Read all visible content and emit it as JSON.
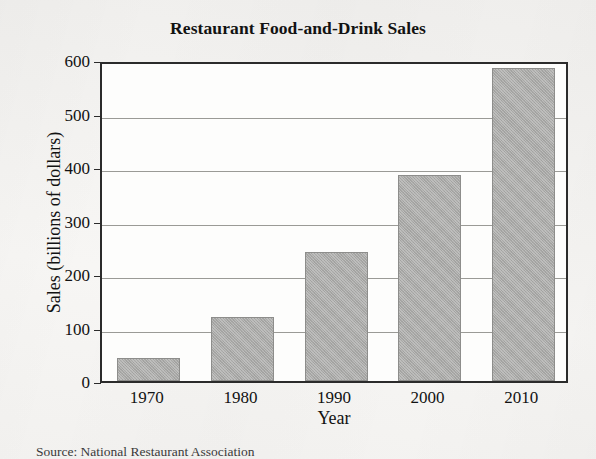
{
  "chart_data": {
    "type": "bar",
    "title": "Restaurant Food-and-Drink Sales",
    "xlabel": "Year",
    "ylabel": "Sales (billions of dollars)",
    "categories": [
      "1970",
      "1980",
      "1990",
      "2000",
      "2010"
    ],
    "values": [
      43,
      120,
      242,
      385,
      585
    ],
    "ylim": [
      0,
      600
    ],
    "yticks": [
      0,
      100,
      200,
      300,
      400,
      500,
      600
    ],
    "ytick_labels": [
      "0",
      "100",
      "200",
      "300",
      "400",
      "500",
      "600"
    ],
    "grid": true,
    "legend": false,
    "series": [
      {
        "name": "Sales",
        "values": [
          43,
          120,
          242,
          385,
          585
        ],
        "color": "#a9a9a7"
      }
    ],
    "source_note": "Source: National Restaurant Association",
    "colors": {
      "bar_fill": "#a9a9a7",
      "bar_border": "#8d8d8b",
      "frame": "#2b2b2b",
      "gridline": "#9a9a96",
      "plot_background": "#fdfdfc",
      "page_background": "#f5f4f2",
      "text": "#121212"
    }
  }
}
